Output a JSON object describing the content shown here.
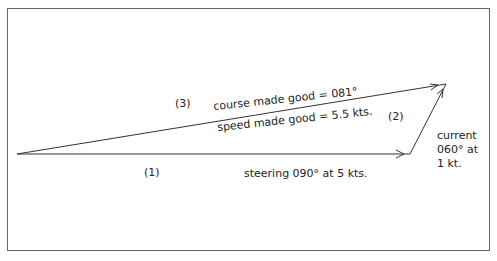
{
  "diagram": {
    "type": "vector-triangle",
    "labels": {
      "leg1_number": "(1)",
      "leg2_number": "(2)",
      "leg3_number": "(3)",
      "leg1_text": "steering 090° at 5 kts.",
      "leg3_course": "course made good = 081°",
      "leg3_speed": "speed made good = 5.5 kts.",
      "current_line1": "current",
      "current_line2": "060° at",
      "current_line3": "1 kt."
    },
    "colors": {
      "line": "#333333",
      "frame": "#666666",
      "background": "#ffffff"
    },
    "vectors": [
      {
        "id": "leg1",
        "label": "steering 090° at 5 kts.",
        "heading": "090°",
        "speed": "5 kts",
        "from": [
          17,
          154
        ],
        "to": [
          410,
          154
        ]
      },
      {
        "id": "leg2",
        "label": "current 060° at 1 kt.",
        "heading": "060°",
        "speed": "1 kt",
        "from": [
          410,
          154
        ],
        "to": [
          446,
          84
        ]
      },
      {
        "id": "leg3",
        "label": "course made good = 081°, speed made good = 5.5 kts.",
        "heading": "081°",
        "speed": "5.5 kts",
        "from": [
          17,
          154
        ],
        "to": [
          446,
          84
        ]
      }
    ]
  }
}
